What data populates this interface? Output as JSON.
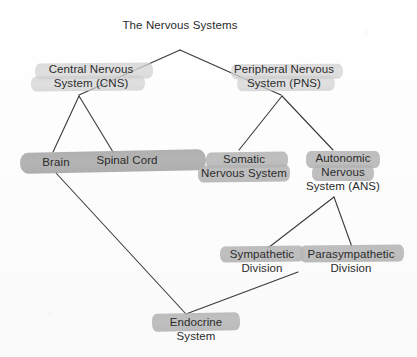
{
  "diagram": {
    "title": "The Nervous Systems",
    "type": "hierarchy-tree",
    "nodes": [
      {
        "id": "title",
        "label_lines": [
          "The Nervous Systems"
        ],
        "highlight": "none"
      },
      {
        "id": "cns",
        "label_lines": [
          "Central Nervous",
          "System (CNS)"
        ],
        "highlight": "light"
      },
      {
        "id": "pns",
        "label_lines": [
          "Peripheral Nervous",
          "System (PNS)"
        ],
        "highlight": "light"
      },
      {
        "id": "brain",
        "label_lines": [
          "Brain"
        ],
        "highlight": "dark"
      },
      {
        "id": "spinal-cord",
        "label_lines": [
          "Spinal Cord"
        ],
        "highlight": "dark"
      },
      {
        "id": "somatic",
        "label_lines": [
          "Somatic",
          "Nervous System"
        ],
        "highlight": "mid"
      },
      {
        "id": "autonomic",
        "label_lines": [
          "Autonomic",
          "Nervous",
          "System (ANS)"
        ],
        "highlight": "mid"
      },
      {
        "id": "sympathetic",
        "label_lines": [
          "Sympathetic",
          "Division"
        ],
        "highlight": "mid"
      },
      {
        "id": "parasympathetic",
        "label_lines": [
          "Parasympathetic",
          "Division"
        ],
        "highlight": "mid"
      },
      {
        "id": "endocrine",
        "label_lines": [
          "Endocrine",
          "System"
        ],
        "highlight": "mid"
      }
    ],
    "edges": [
      {
        "from": "title",
        "to": "cns"
      },
      {
        "from": "title",
        "to": "pns"
      },
      {
        "from": "cns",
        "to": "brain"
      },
      {
        "from": "cns",
        "to": "spinal-cord"
      },
      {
        "from": "pns",
        "to": "somatic"
      },
      {
        "from": "pns",
        "to": "autonomic"
      },
      {
        "from": "autonomic",
        "to": "sympathetic"
      },
      {
        "from": "autonomic",
        "to": "parasympathetic"
      },
      {
        "from": "brain",
        "to": "endocrine"
      },
      {
        "from": "sympathetic",
        "to": "endocrine"
      }
    ],
    "colors": {
      "background": "#fdfdfd",
      "text": "#2b2b2b",
      "line": "#3a3a3a",
      "highlight_light": "#d2d2d2",
      "highlight_mid": "#b6b6b6",
      "highlight_dark": "#ababab"
    }
  },
  "labels": {
    "title": "The Nervous Systems",
    "cns_l1": "Central Nervous",
    "cns_l2": "System (CNS)",
    "pns_l1": "Peripheral Nervous",
    "pns_l2": "System (PNS)",
    "brain": "Brain",
    "spinal_cord": "Spinal Cord",
    "somatic_l1": "Somatic",
    "somatic_l2": "Nervous System",
    "autonomic_l1": "Autonomic",
    "autonomic_l2": "Nervous",
    "autonomic_l3": "System (ANS)",
    "sympathetic_l1": "Sympathetic",
    "sympathetic_l2": "Division",
    "parasympathetic_l1": "Parasympathetic",
    "parasympathetic_l2": "Division",
    "endocrine_l1": "Endocrine",
    "endocrine_l2": "System"
  }
}
